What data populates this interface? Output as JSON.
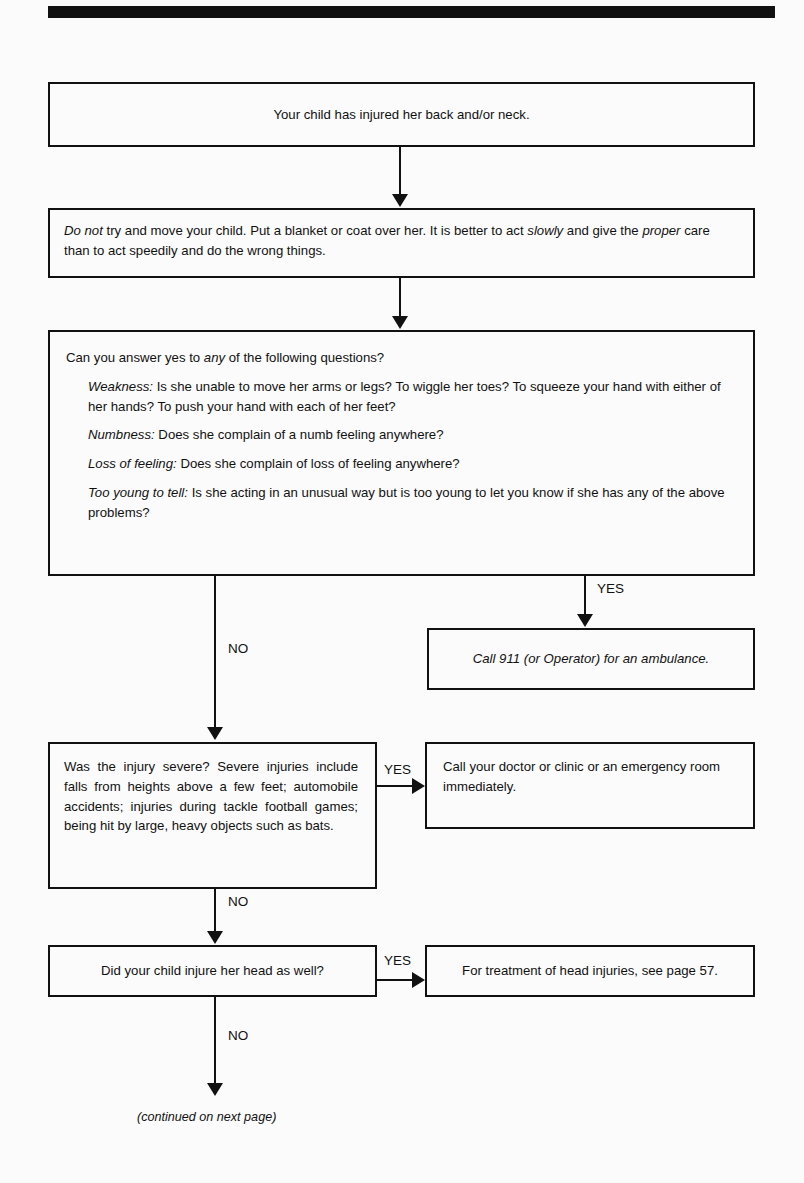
{
  "page": {
    "title": "Your child has injured her back and/or neck.",
    "continued_note": "(continued on next page)"
  },
  "boxes": {
    "intro": {
      "text": "Your child has injured her back and/or neck."
    },
    "do_not_move": {
      "segments": [
        {
          "text": "Do not",
          "italic": true
        },
        {
          "text": " try and move your child. Put a blanket or coat over her. It is better to act ",
          "italic": false
        },
        {
          "text": "slowly",
          "italic": true
        },
        {
          "text": " and give the ",
          "italic": false
        },
        {
          "text": "proper",
          "italic": true
        },
        {
          "text": " care than to act speedily and do the wrong things.",
          "italic": false
        }
      ]
    },
    "questions": {
      "intro_segments": [
        {
          "text": "Can you answer yes to ",
          "italic": false
        },
        {
          "text": "any",
          "italic": true
        },
        {
          "text": " of the following questions?",
          "italic": false
        }
      ],
      "items": [
        {
          "label": "Weakness:",
          "body": " Is she unable to move her arms or legs? To wiggle her toes? To squeeze your hand with either of her hands? To push your hand with each of her feet?"
        },
        {
          "label": "Numbness:",
          "body": " Does she complain of a numb feeling anywhere?"
        },
        {
          "label": "Loss of feeling:",
          "body": " Does she complain of loss of feeling anywhere?"
        },
        {
          "label": "Too young to tell:",
          "body": " Is she acting in an unusual way but is too young to let you know if she has any of the above problems?"
        }
      ]
    },
    "ambulance": {
      "text": "Call 911 (or Operator) for an ambulance."
    },
    "severe": {
      "text": "Was the injury severe? Severe injuries include falls from heights above a few feet; automobile accidents; injuries during tackle football games; being hit by large, heavy objects such as bats."
    },
    "call_clinic": {
      "text": "Call your doctor or clinic or an emergency room immediately."
    },
    "head_question": {
      "text": "Did your child injure her head as well?"
    },
    "head_treatment": {
      "text": "For treatment of head injuries, see page 57."
    }
  },
  "edges": {
    "questions_yes": "YES",
    "questions_no": "NO",
    "severe_yes": "YES",
    "severe_no": "NO",
    "head_yes": "YES",
    "head_no": "NO"
  },
  "colors": {
    "ink": "#111111",
    "paper": "#fbfbfb"
  }
}
